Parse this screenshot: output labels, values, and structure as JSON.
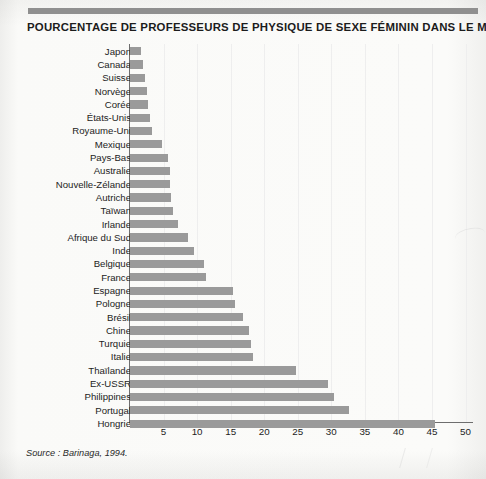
{
  "title": "POURCENTAGE DE PROFESSEURS DE PHYSIQUE DE SEXE FÉMININ DANS LE MONDE",
  "source": "Source : Barinaga, 1994.",
  "colors": {
    "bar": "#9a9a9a",
    "axis": "#6e6e6e",
    "grid": "#eeeeee",
    "text": "#1c1c1c",
    "page": "#fbfbfa",
    "top_rule": "#8f8f8f"
  },
  "chart_data": {
    "type": "bar",
    "orientation": "horizontal",
    "title": "POURCENTAGE DE PROFESSEURS DE PHYSIQUE DE SEXE FÉMININ DANS LE MONDE",
    "xlabel": "",
    "ylabel": "",
    "xlim": [
      0,
      52
    ],
    "grid": true,
    "legend": false,
    "source": "Source : Barinaga, 1994.",
    "tick_labels": [
      "5",
      "10",
      "15",
      "20",
      "25",
      "30",
      "35",
      "40",
      "45",
      "50"
    ],
    "ticks": [
      5,
      10,
      15,
      20,
      25,
      30,
      35,
      40,
      45,
      50
    ],
    "categories": [
      "Japon",
      "Canada",
      "Suisse",
      "Norvège",
      "Corée",
      "États-Unis",
      "Royaume-Uni",
      "Mexique",
      "Pays-Bas",
      "Australie",
      "Nouvelle-Zélande",
      "Autriche",
      "Taïwan",
      "Irlande",
      "Afrique du Sud",
      "Inde",
      "Belgique",
      "France",
      "Espagne",
      "Pologne",
      "Brésil",
      "Chine",
      "Turquie",
      "Italie",
      "Thaïlande",
      "Ex-USSR",
      "Philippines",
      "Portugal",
      "Hongrie"
    ],
    "values": [
      1.7,
      2.0,
      2.2,
      2.5,
      2.7,
      3.0,
      3.3,
      4.8,
      5.7,
      5.9,
      5.9,
      6.1,
      6.4,
      7.1,
      8.7,
      9.5,
      11.1,
      11.3,
      15.3,
      15.6,
      16.9,
      17.8,
      18.1,
      18.3,
      24.7,
      29.5,
      30.4,
      32.6,
      45.4
    ]
  }
}
